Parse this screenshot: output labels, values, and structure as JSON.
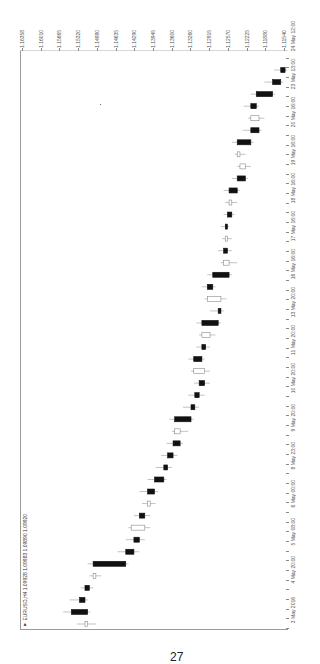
{
  "chart_data": {
    "type": "candlestick",
    "orientation": "rotated-90 (price axis horizontal at top, time axis vertical on right; time increases upward)",
    "symbol": "EURUSD",
    "timeframe": "H4",
    "header": "▼ EURUSD,H4 1.09928 1.09983 1.09890 1.09920",
    "ohlc_current": {
      "open": 1.09928,
      "high": 1.09983,
      "low": 1.0989,
      "close": 1.0992
    },
    "price_axis_labels": [
      "1.16358",
      "1.16010",
      "1.15665",
      "1.15320",
      "1.14980",
      "1.14635",
      "1.14290",
      "1.13945",
      "1.13600",
      "1.13260",
      "1.12915",
      "1.12570",
      "1.12225",
      "1.11880",
      "1.11540"
    ],
    "time_axis_labels": [
      "3 May 2016",
      "4 May 20:00",
      "5 May 08:00",
      "6 May 00:00",
      "8 May 23:00",
      "9 May 20:00",
      "10 May 20:00",
      "11 May 20:00",
      "13 May 20:00",
      "16 May 16:00",
      "17 May 16:00",
      "18 May 16:00",
      "19 May 16:00",
      "20 May 16:00",
      "23 May 13:00",
      "24 May 12:00"
    ],
    "ylim": [
      1.1154,
      1.16358
    ],
    "grid": false,
    "legend": "none",
    "candles": [
      {
        "t": 0,
        "o": 1.1515,
        "h": 1.1535,
        "l": 1.15,
        "c": 1.152,
        "bear": false
      },
      {
        "t": 1,
        "o": 1.1545,
        "h": 1.156,
        "l": 1.151,
        "c": 1.1515,
        "bear": true
      },
      {
        "t": 2,
        "o": 1.153,
        "h": 1.1548,
        "l": 1.1515,
        "c": 1.152,
        "bear": true
      },
      {
        "t": 3,
        "o": 1.152,
        "h": 1.1528,
        "l": 1.1505,
        "c": 1.1512,
        "bear": true
      },
      {
        "t": 4,
        "o": 1.15,
        "h": 1.1512,
        "l": 1.149,
        "c": 1.1505,
        "bear": false
      },
      {
        "t": 5,
        "o": 1.1505,
        "h": 1.1515,
        "l": 1.144,
        "c": 1.1445,
        "bear": true
      },
      {
        "t": 6,
        "o": 1.1445,
        "h": 1.146,
        "l": 1.142,
        "c": 1.143,
        "bear": true
      },
      {
        "t": 7,
        "o": 1.143,
        "h": 1.1445,
        "l": 1.141,
        "c": 1.142,
        "bear": true
      },
      {
        "t": 8,
        "o": 1.141,
        "h": 1.144,
        "l": 1.14,
        "c": 1.1435,
        "bear": false
      },
      {
        "t": 9,
        "o": 1.142,
        "h": 1.143,
        "l": 1.14,
        "c": 1.141,
        "bear": true
      },
      {
        "t": 10,
        "o": 1.14,
        "h": 1.1415,
        "l": 1.139,
        "c": 1.1405,
        "bear": false
      },
      {
        "t": 11,
        "o": 1.1405,
        "h": 1.142,
        "l": 1.1385,
        "c": 1.1392,
        "bear": true
      },
      {
        "t": 12,
        "o": 1.1392,
        "h": 1.1405,
        "l": 1.137,
        "c": 1.1375,
        "bear": true
      },
      {
        "t": 13,
        "o": 1.1375,
        "h": 1.139,
        "l": 1.136,
        "c": 1.1368,
        "bear": true
      },
      {
        "t": 14,
        "o": 1.1368,
        "h": 1.138,
        "l": 1.135,
        "c": 1.1358,
        "bear": true
      },
      {
        "t": 15,
        "o": 1.1358,
        "h": 1.137,
        "l": 1.134,
        "c": 1.1345,
        "bear": true
      },
      {
        "t": 16,
        "o": 1.1345,
        "h": 1.136,
        "l": 1.133,
        "c": 1.1355,
        "bear": false
      },
      {
        "t": 17,
        "o": 1.1355,
        "h": 1.1365,
        "l": 1.132,
        "c": 1.1325,
        "bear": true
      },
      {
        "t": 18,
        "o": 1.1325,
        "h": 1.134,
        "l": 1.131,
        "c": 1.1318,
        "bear": true
      },
      {
        "t": 19,
        "o": 1.1318,
        "h": 1.133,
        "l": 1.13,
        "c": 1.131,
        "bear": true
      },
      {
        "t": 20,
        "o": 1.131,
        "h": 1.132,
        "l": 1.129,
        "c": 1.13,
        "bear": true
      },
      {
        "t": 21,
        "o": 1.13,
        "h": 1.1325,
        "l": 1.129,
        "c": 1.132,
        "bear": false
      },
      {
        "t": 22,
        "o": 1.132,
        "h": 1.133,
        "l": 1.13,
        "c": 1.1305,
        "bear": true
      },
      {
        "t": 23,
        "o": 1.1305,
        "h": 1.1315,
        "l": 1.129,
        "c": 1.1298,
        "bear": true
      },
      {
        "t": 24,
        "o": 1.129,
        "h": 1.131,
        "l": 1.128,
        "c": 1.1305,
        "bear": false
      },
      {
        "t": 25,
        "o": 1.1305,
        "h": 1.1315,
        "l": 1.127,
        "c": 1.1275,
        "bear": true
      },
      {
        "t": 26,
        "o": 1.1275,
        "h": 1.129,
        "l": 1.1265,
        "c": 1.127,
        "bear": true
      },
      {
        "t": 27,
        "o": 1.127,
        "h": 1.13,
        "l": 1.126,
        "c": 1.1295,
        "bear": false
      },
      {
        "t": 28,
        "o": 1.1295,
        "h": 1.1305,
        "l": 1.128,
        "c": 1.1285,
        "bear": true
      },
      {
        "t": 29,
        "o": 1.1285,
        "h": 1.1295,
        "l": 1.125,
        "c": 1.1255,
        "bear": true
      },
      {
        "t": 30,
        "o": 1.1255,
        "h": 1.127,
        "l": 1.124,
        "c": 1.1265,
        "bear": false
      },
      {
        "t": 31,
        "o": 1.1265,
        "h": 1.1275,
        "l": 1.125,
        "c": 1.1258,
        "bear": true
      },
      {
        "t": 32,
        "o": 1.1258,
        "h": 1.1268,
        "l": 1.125,
        "c": 1.1262,
        "bear": false
      },
      {
        "t": 33,
        "o": 1.1262,
        "h": 1.127,
        "l": 1.1255,
        "c": 1.1258,
        "bear": true
      },
      {
        "t": 34,
        "o": 1.1258,
        "h": 1.1265,
        "l": 1.1245,
        "c": 1.125,
        "bear": true
      },
      {
        "t": 35,
        "o": 1.125,
        "h": 1.1262,
        "l": 1.124,
        "c": 1.1255,
        "bear": false
      },
      {
        "t": 36,
        "o": 1.1255,
        "h": 1.1265,
        "l": 1.1235,
        "c": 1.124,
        "bear": true
      },
      {
        "t": 37,
        "o": 1.124,
        "h": 1.125,
        "l": 1.122,
        "c": 1.1225,
        "bear": true
      },
      {
        "t": 38,
        "o": 1.1225,
        "h": 1.124,
        "l": 1.1215,
        "c": 1.1235,
        "bear": false
      },
      {
        "t": 39,
        "o": 1.1235,
        "h": 1.1245,
        "l": 1.1225,
        "c": 1.124,
        "bear": false
      },
      {
        "t": 40,
        "o": 1.124,
        "h": 1.125,
        "l": 1.121,
        "c": 1.1215,
        "bear": true
      },
      {
        "t": 41,
        "o": 1.1215,
        "h": 1.123,
        "l": 1.1195,
        "c": 1.12,
        "bear": true
      },
      {
        "t": 42,
        "o": 1.12,
        "h": 1.122,
        "l": 1.119,
        "c": 1.1215,
        "bear": false
      },
      {
        "t": 43,
        "o": 1.1215,
        "h": 1.1228,
        "l": 1.12,
        "c": 1.1205,
        "bear": true
      },
      {
        "t": 44,
        "o": 1.1205,
        "h": 1.1215,
        "l": 1.117,
        "c": 1.1175,
        "bear": true
      },
      {
        "t": 45,
        "o": 1.1175,
        "h": 1.119,
        "l": 1.1155,
        "c": 1.116,
        "bear": true
      },
      {
        "t": 46,
        "o": 1.116,
        "h": 1.1172,
        "l": 1.1148,
        "c": 1.1152,
        "bear": true
      }
    ]
  },
  "page": {
    "number": "27"
  }
}
